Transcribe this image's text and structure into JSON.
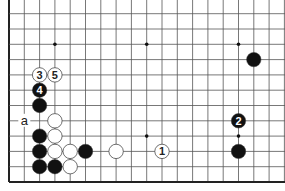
{
  "diagram": {
    "type": "go-board-partial",
    "board_size": 19,
    "visible_rows_from_bottom": 12,
    "grid": {
      "origin_x": 9,
      "bottom_y": 182,
      "spacing": 15.3,
      "columns": 19,
      "rows": 12
    },
    "hoshi": [
      {
        "col": 3,
        "row": 3
      },
      {
        "col": 9,
        "row": 3
      },
      {
        "col": 15,
        "row": 3
      },
      {
        "col": 3,
        "row": 9
      },
      {
        "col": 9,
        "row": 9
      },
      {
        "col": 15,
        "row": 9
      }
    ],
    "stones": [
      {
        "color": "white",
        "col": 2,
        "row": 7,
        "label": "3"
      },
      {
        "color": "white",
        "col": 3,
        "row": 7,
        "label": "5"
      },
      {
        "color": "black",
        "col": 2,
        "row": 6,
        "label": "4"
      },
      {
        "color": "black",
        "col": 2,
        "row": 5,
        "label": ""
      },
      {
        "color": "white",
        "col": 3,
        "row": 4,
        "label": ""
      },
      {
        "color": "black",
        "col": 2,
        "row": 3,
        "label": ""
      },
      {
        "color": "white",
        "col": 3,
        "row": 3,
        "label": ""
      },
      {
        "color": "black",
        "col": 2,
        "row": 2,
        "label": ""
      },
      {
        "color": "white",
        "col": 3,
        "row": 2,
        "label": ""
      },
      {
        "color": "white",
        "col": 4,
        "row": 2,
        "label": ""
      },
      {
        "color": "black",
        "col": 5,
        "row": 2,
        "label": ""
      },
      {
        "color": "white",
        "col": 7,
        "row": 2,
        "label": ""
      },
      {
        "color": "white",
        "col": 10,
        "row": 2,
        "label": "1"
      },
      {
        "color": "black",
        "col": 2,
        "row": 1,
        "label": ""
      },
      {
        "color": "black",
        "col": 3,
        "row": 1,
        "label": ""
      },
      {
        "color": "white",
        "col": 4,
        "row": 1,
        "label": ""
      },
      {
        "color": "black",
        "col": 15,
        "row": 4,
        "label": "2"
      },
      {
        "color": "black",
        "col": 15,
        "row": 2,
        "label": ""
      },
      {
        "color": "black",
        "col": 16,
        "row": 8,
        "label": ""
      }
    ],
    "markers": [
      {
        "col": 1,
        "row": 4,
        "text": "a"
      }
    ],
    "colors": {
      "line": "#555555",
      "border": "#222222",
      "black_stone": "#111111",
      "white_stone": "#ffffff",
      "stone_outline": "#333333"
    }
  }
}
